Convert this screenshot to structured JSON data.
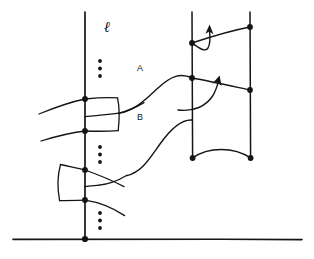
{
  "figure": {
    "background_color": "#ffffff",
    "ink_color": "#151515",
    "width": 314,
    "height": 259,
    "labels": {
      "curve_a": "A",
      "curve_b": "B",
      "line_ell": "ℓ"
    },
    "ellipsis_glyph": "⋮",
    "vertical_lines": [
      {
        "name": "line-ell-left",
        "x": 85,
        "y_top": 12,
        "y_bottom": 240
      },
      {
        "name": "line-right-inner",
        "x": 192,
        "y_top": 12,
        "y_bottom": 158
      },
      {
        "name": "line-right-outer",
        "x": 250,
        "y_top": 12,
        "y_bottom": 158
      }
    ],
    "horizontal_lines": [
      {
        "name": "baseline",
        "x_start": 13,
        "x_end": 302,
        "y": 239
      }
    ],
    "dots": [
      {
        "name": "dot-left-upper",
        "x": 85,
        "y": 99
      },
      {
        "name": "dot-left-lower",
        "x": 85,
        "y": 131
      },
      {
        "name": "dot-left-box2-upper",
        "x": 85,
        "y": 170
      },
      {
        "name": "dot-left-box2-lower",
        "x": 85,
        "y": 200
      },
      {
        "name": "dot-baseline",
        "x": 85,
        "y": 239
      },
      {
        "name": "dot-right-inner-a",
        "x": 192,
        "y": 43
      },
      {
        "name": "dot-right-inner-b",
        "x": 192,
        "y": 78
      },
      {
        "name": "dot-right-inner-c",
        "x": 192,
        "y": 158
      },
      {
        "name": "dot-right-outer-a",
        "x": 250,
        "y": 27
      },
      {
        "name": "dot-right-outer-b",
        "x": 250,
        "y": 90
      },
      {
        "name": "dot-right-outer-c",
        "x": 250,
        "y": 158
      }
    ],
    "dot_columns": [
      {
        "name": "ellipsis-top",
        "x": 100,
        "y_start": 61,
        "count": 3
      },
      {
        "name": "ellipsis-middle",
        "x": 100,
        "y_start": 147,
        "count": 3
      },
      {
        "name": "ellipsis-bottom",
        "x": 100,
        "y_start": 213,
        "count": 3
      }
    ],
    "arrows": [
      {
        "name": "arrow-upper",
        "direction": "up"
      },
      {
        "name": "arrow-lower",
        "direction": "up-right"
      }
    ]
  }
}
